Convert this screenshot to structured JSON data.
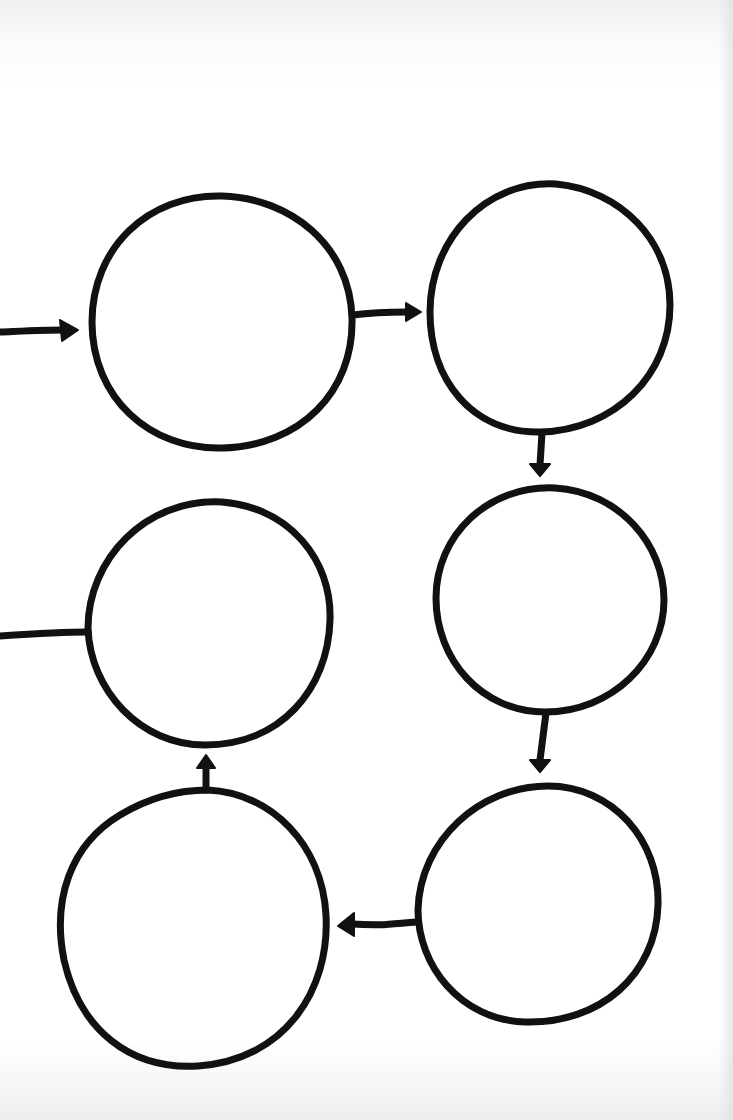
{
  "diagram": {
    "title": "",
    "type": "cycle flow chart (hand-drawn, blank nodes)",
    "ink_color": "#111111",
    "background_color": "#ffffff",
    "nodes": [
      {
        "id": "n1",
        "label": "",
        "position": "top-left"
      },
      {
        "id": "n2",
        "label": "",
        "position": "top-right"
      },
      {
        "id": "n3",
        "label": "",
        "position": "middle-right"
      },
      {
        "id": "n4",
        "label": "",
        "position": "bottom-right"
      },
      {
        "id": "n5",
        "label": "",
        "position": "bottom-left"
      },
      {
        "id": "n6",
        "label": "",
        "position": "middle-left"
      }
    ],
    "edges": [
      {
        "from": "entry",
        "to": "n1",
        "arrow": true
      },
      {
        "from": "n1",
        "to": "n2",
        "arrow": true
      },
      {
        "from": "n2",
        "to": "n3",
        "arrow": true
      },
      {
        "from": "n3",
        "to": "n4",
        "arrow": true
      },
      {
        "from": "n4",
        "to": "n5",
        "arrow": true
      },
      {
        "from": "n5",
        "to": "n6",
        "arrow": true
      },
      {
        "from": "n6",
        "to": "exit",
        "arrow": false
      }
    ]
  }
}
